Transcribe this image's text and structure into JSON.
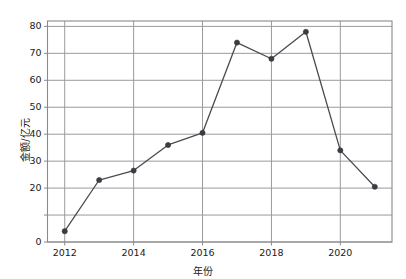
{
  "chart_data": {
    "type": "line",
    "title": "",
    "xlabel": "年份",
    "ylabel": "金额/亿元",
    "x": [
      2012,
      2013,
      2014,
      2015,
      2016,
      2017,
      2018,
      2019,
      2020,
      2021
    ],
    "values": [
      4,
      23,
      26.5,
      36,
      40.5,
      74,
      68,
      78,
      34,
      20.5
    ],
    "series": [
      {
        "name": "金额",
        "values": [
          4,
          23,
          26.5,
          36,
          40.5,
          74,
          68,
          78,
          34,
          20.5
        ]
      }
    ],
    "xlim": [
      2011.5,
      2021.5
    ],
    "ylim": [
      0,
      82
    ],
    "xticks": [
      2012,
      2014,
      2016,
      2018,
      2020
    ],
    "xtick_labels": [
      "2012",
      "2014",
      "2016",
      "2018",
      "2020"
    ],
    "yticks": [
      0,
      10,
      20,
      30,
      40,
      50,
      60,
      70,
      80
    ],
    "ytick_labels": [
      "0",
      "10",
      "20",
      "30",
      "40",
      "50",
      "60",
      "70",
      "80"
    ],
    "ytick_labels_shown": [
      "0",
      "20",
      "30",
      "40",
      "50",
      "60",
      "70",
      "80"
    ],
    "grid": true,
    "grid_x": true,
    "grid_y": true,
    "legend": "none",
    "line_color": "#4a4a52",
    "marker_color": "#3b3b42",
    "marker": "circle",
    "grid_color": "#9a9a9a",
    "frame_color": "#8a8a8a",
    "background": "#ffffff"
  }
}
